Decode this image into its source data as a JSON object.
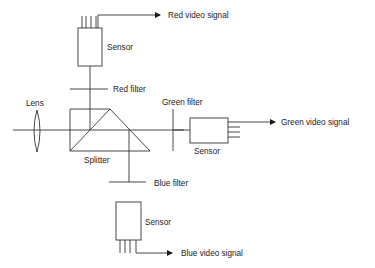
{
  "diagram": {
    "colors": {
      "line": "#333333",
      "text": "#1a1a1a",
      "background": "#ffffff"
    },
    "labels": {
      "lens": "Lens",
      "splitter": "Splitter",
      "red_filter": "Red filter",
      "green_filter": "Green filter",
      "blue_filter": "Blue filter",
      "red_sensor": "Sensor",
      "green_sensor": "Sensor",
      "blue_sensor": "Sensor",
      "red_signal": "Red video signal",
      "green_signal": "Green video signal",
      "blue_signal": "Blue video signal"
    },
    "nodes": [
      {
        "id": "lens",
        "label": "Lens"
      },
      {
        "id": "splitter",
        "label": "Splitter"
      },
      {
        "id": "red_filter",
        "label": "Red filter"
      },
      {
        "id": "green_filter",
        "label": "Green filter"
      },
      {
        "id": "blue_filter",
        "label": "Blue filter"
      },
      {
        "id": "red_sensor",
        "label": "Sensor"
      },
      {
        "id": "green_sensor",
        "label": "Sensor"
      },
      {
        "id": "blue_sensor",
        "label": "Sensor"
      }
    ],
    "edges": [
      {
        "from": "lens",
        "to": "splitter"
      },
      {
        "from": "splitter",
        "to": "red_filter"
      },
      {
        "from": "red_filter",
        "to": "red_sensor"
      },
      {
        "from": "red_sensor",
        "to": "Red video signal"
      },
      {
        "from": "splitter",
        "to": "green_filter"
      },
      {
        "from": "green_filter",
        "to": "green_sensor"
      },
      {
        "from": "green_sensor",
        "to": "Green video signal"
      },
      {
        "from": "splitter",
        "to": "blue_filter"
      },
      {
        "from": "blue_filter",
        "to": "blue_sensor"
      },
      {
        "from": "blue_sensor",
        "to": "Blue video signal"
      }
    ]
  }
}
